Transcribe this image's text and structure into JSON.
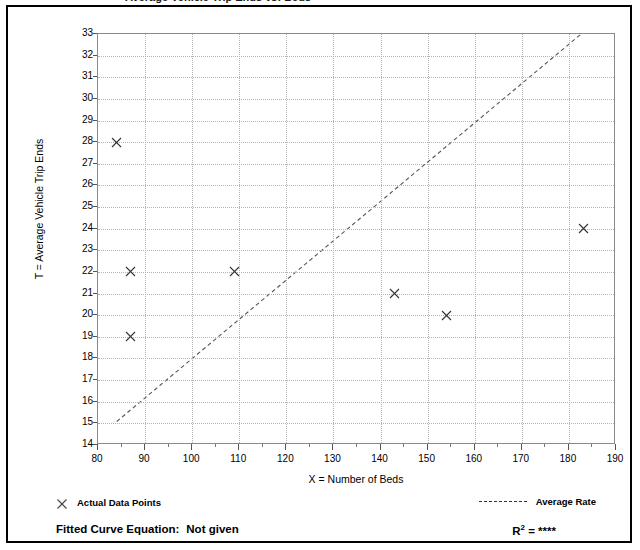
{
  "figure": {
    "clipped_title": "Average Vehicle Trip Ends vs: Beds"
  },
  "chart_data": {
    "type": "scatter",
    "title": "",
    "xlabel": "X = Number of Beds",
    "ylabel": "T = Average Vehicle Trip Ends",
    "xlim": [
      80,
      190
    ],
    "ylim": [
      14,
      33
    ],
    "x_tick_step": 10,
    "x_minor_step": 5,
    "y_tick_step": 1,
    "grid": true,
    "x_ticks": [
      80,
      90,
      100,
      110,
      120,
      130,
      140,
      150,
      160,
      170,
      180,
      190
    ],
    "y_ticks": [
      14,
      15,
      16,
      17,
      18,
      19,
      20,
      21,
      22,
      23,
      24,
      25,
      26,
      27,
      28,
      29,
      30,
      31,
      32,
      33
    ],
    "series": [
      {
        "name": "Actual Data Points",
        "type": "scatter",
        "marker": "x",
        "points": [
          {
            "x": 84,
            "y": 28
          },
          {
            "x": 87,
            "y": 22
          },
          {
            "x": 87,
            "y": 19
          },
          {
            "x": 109,
            "y": 22
          },
          {
            "x": 143,
            "y": 21
          },
          {
            "x": 154,
            "y": 20
          },
          {
            "x": 183,
            "y": 24
          }
        ]
      },
      {
        "name": "Average Rate",
        "type": "line",
        "style": "dashed",
        "endpoints": [
          {
            "x": 84,
            "y": 15.0
          },
          {
            "x": 183,
            "y": 33.0
          }
        ]
      }
    ],
    "legend": [
      {
        "label": "Actual Data Points",
        "marker": "x",
        "position": "bottom-left"
      },
      {
        "label": "Average Rate",
        "marker": "dashed-line",
        "position": "bottom-right"
      }
    ],
    "annotations": {
      "fitted_curve_label": "Fitted Curve Equation:",
      "fitted_curve_value": "Not given",
      "r_squared_label": "R",
      "r_squared_exponent": "2",
      "r_squared_equals": "=",
      "r_squared_value": "****"
    }
  },
  "colors": {
    "frame": "#000000",
    "plot_border": "#8a8a8a",
    "gridline": "#b4b4b4",
    "marker": "#333333",
    "trendline": "#555555",
    "text": "#000000"
  }
}
